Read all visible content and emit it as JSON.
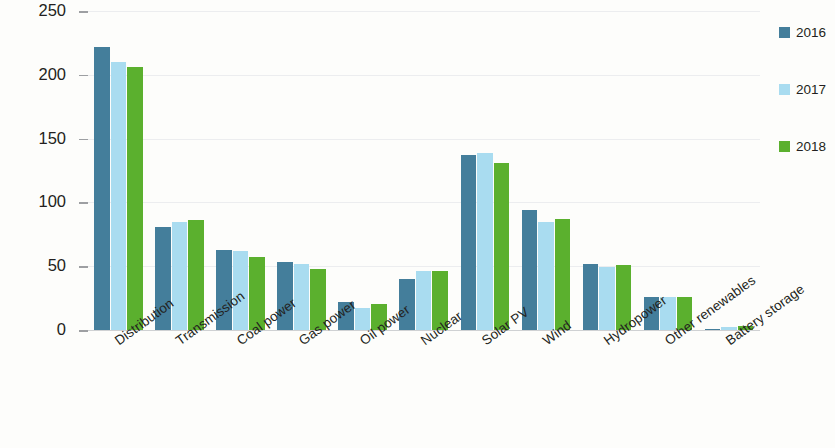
{
  "chart_data": {
    "type": "bar",
    "title": "",
    "subtitle": "",
    "xlabel": "",
    "ylabel": "USD (2018) billion",
    "ylim": [
      0,
      250
    ],
    "yticks": [
      0,
      50,
      100,
      150,
      200,
      250
    ],
    "grid": true,
    "legend_position": "right",
    "categories": [
      "Distribution",
      "Transmission",
      "Coal power",
      "Gas power",
      "Oil power",
      "Nuclear",
      "Solar PV",
      "Wind",
      "Hydropower",
      "Other renewables",
      "Battery storage"
    ],
    "series": [
      {
        "name": "2016",
        "color": "#447e9b",
        "values": [
          222,
          81,
          63,
          53,
          22,
          40,
          137,
          94,
          52,
          26,
          1
        ]
      },
      {
        "name": "2017",
        "color": "#a9dcf0",
        "values": [
          210,
          85,
          62,
          52,
          17,
          46,
          139,
          85,
          49,
          26,
          2
        ]
      },
      {
        "name": "2018",
        "color": "#5bb02e",
        "values": [
          206,
          86,
          57,
          48,
          20,
          46,
          131,
          87,
          51,
          26,
          3
        ]
      }
    ]
  },
  "legend": {
    "items": [
      {
        "label": "2016",
        "color": "#447e9b"
      },
      {
        "label": "2017",
        "color": "#a9dcf0"
      },
      {
        "label": "2018",
        "color": "#5bb02e"
      }
    ]
  },
  "axis": {
    "y_title": "USD (2018) billion",
    "y_tick_labels": [
      "0",
      "50",
      "100",
      "150",
      "200",
      "250"
    ]
  }
}
